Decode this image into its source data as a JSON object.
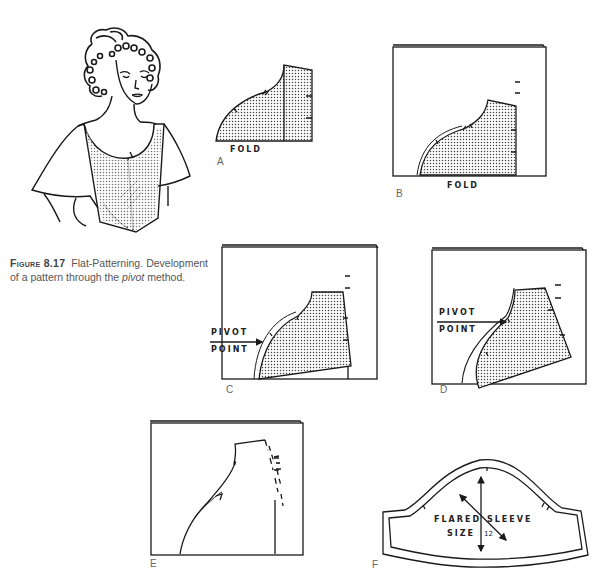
{
  "figure": {
    "number_label": "Figure 8.17",
    "caption_title": "Flat-Patterning.",
    "caption_body_1": "Development of a pattern through the",
    "caption_italic": "pivot",
    "caption_body_2": "method."
  },
  "panels": [
    {
      "id": "A",
      "letter": "A",
      "labels": [
        "FOLD"
      ],
      "description": "Bodice pattern piece placed on fold with straight grain section"
    },
    {
      "id": "B",
      "letter": "B",
      "labels": [
        "FOLD"
      ],
      "description": "Pattern traced onto folded paper"
    },
    {
      "id": "C",
      "letter": "C",
      "labels": [
        "PIVOT",
        "POINT"
      ],
      "description": "Pattern pivoted at pivot point on paper"
    },
    {
      "id": "D",
      "letter": "D",
      "labels": [
        "PIVOT",
        "POINT"
      ],
      "description": "Pattern pivoted further to widen"
    },
    {
      "id": "E",
      "letter": "E",
      "labels": [],
      "description": "Resulting traced outline with dashed grain lines"
    },
    {
      "id": "F",
      "letter": "F",
      "labels": [
        "FLARED",
        "SLEEVE",
        "SIZE",
        "12"
      ],
      "description": "Final flared sleeve pattern piece with seam allowance"
    }
  ],
  "labels": {
    "a_fold": "FOLD",
    "b_fold": "FOLD",
    "c_pivot": "PIVOT",
    "c_point": "POINT",
    "d_pivot": "PIVOT",
    "d_point": "POINT",
    "f_flared": "FLARED",
    "f_sleeve": "SLEEVE",
    "f_size": "SIZE",
    "f_size_num": "12",
    "letter_a": "A",
    "letter_b": "B",
    "letter_c": "C",
    "letter_d": "D",
    "letter_e": "E",
    "letter_f": "F"
  },
  "colors": {
    "ink": "#1a1a1a",
    "dot_fill": "#bdbdbd",
    "caption_text": "#555555",
    "background": "#ffffff"
  }
}
